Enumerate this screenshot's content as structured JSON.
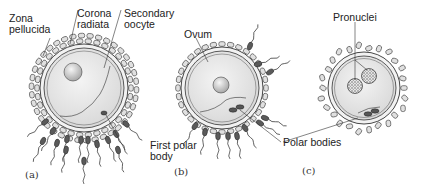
{
  "figure": {
    "panels": [
      {
        "id": "a",
        "label": "(a)",
        "annotations": {
          "zona_pellucida_1": "Zona",
          "zona_pellucida_2": "pellucida",
          "corona_radiata_1": "Corona",
          "corona_radiata_2": "radiata",
          "secondary_oocyte_1": "Secondary",
          "secondary_oocyte_2": "oocyte",
          "first_polar_body_1": "First polar",
          "first_polar_body_2": "body"
        }
      },
      {
        "id": "b",
        "label": "(b)",
        "annotations": {
          "ovum": "Ovum"
        }
      },
      {
        "id": "c",
        "label": "(c)",
        "annotations": {
          "pronuclei": "Pronuclei"
        }
      }
    ],
    "shared_annotations": {
      "polar_bodies": "Polar bodies"
    },
    "colors": {
      "cytoplasm": "#e6e6e6",
      "cell_outline": "#333333",
      "corona_cell": "#d8d8d8",
      "nucleus": "#cfcfcf",
      "sperm_head": "#555555"
    }
  }
}
